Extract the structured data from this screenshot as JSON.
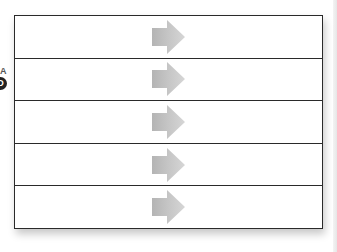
{
  "diagram": {
    "type": "stacked-rows-with-arrows",
    "row_count": 5,
    "rows": [
      {
        "label": "",
        "icon": "right-arrow-icon"
      },
      {
        "label": "",
        "icon": "right-arrow-icon"
      },
      {
        "label": "",
        "icon": "right-arrow-icon"
      },
      {
        "label": "",
        "icon": "right-arrow-icon"
      },
      {
        "label": "",
        "icon": "right-arrow-icon"
      }
    ],
    "border_color": "#2a2a2a",
    "arrow_color_light": "#d2d2d2",
    "arrow_color_dark": "#b4b4b4"
  },
  "left_badge": {
    "top_text": "A",
    "circle_text": "D"
  }
}
